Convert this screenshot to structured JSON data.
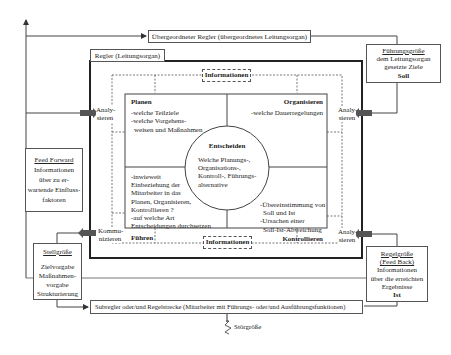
{
  "title_top": "Übergeordneter Regler (übergeordnetes Leitungsorgan)",
  "regler_label": "Regler (Leitungsorgan)",
  "info_top": "Informationen",
  "info_bottom": "Informationen",
  "side_labels": {
    "analysieren_left": [
      "Analy-",
      "sieren"
    ],
    "analysieren_right_top": [
      "Analy-",
      "sieren"
    ],
    "analysieren_right_bottom": [
      "Analy-",
      "sieren"
    ],
    "kommunizieren": [
      "Kommu-",
      "nizieren"
    ]
  },
  "quadrants": {
    "planen": {
      "title": "Planen",
      "lines": [
        "-welche Teilziele",
        "-welche Vorgehens-",
        " weisen und Maßnahmen"
      ]
    },
    "organisieren": {
      "title": "Organisieren",
      "lines": [
        "-welche Dauerregelungen"
      ]
    },
    "fuehren": {
      "title": "Führen",
      "lines": [
        "-inwieweit",
        "Einbeziehung der",
        "Mitarbeiter in das",
        "Planen, Organisieren,",
        "Kontrollieren ?",
        "-auf welche Art",
        "Entscheidungen durchsetzen"
      ]
    },
    "kontrollieren": {
      "title": "Kontrollieren",
      "lines": [
        "-Übereinstimmung von",
        "Soll und Ist",
        "-Ursachen einer",
        "Soll-Ist-Abweichung"
      ]
    }
  },
  "center": {
    "title": "Entscheiden",
    "lines": [
      "Welche Planungs-,",
      "Organisations-,",
      "Kontroll-, Führungs-",
      "alternative"
    ]
  },
  "fuehrungsgroesse": {
    "title": "Führungsgröße",
    "lines": [
      "dem Leitungsorgan",
      "gesetzte Ziele"
    ],
    "bold": "Soll"
  },
  "feed_forward": {
    "title": "Feed Forward",
    "lines": [
      "Informationen",
      "über zu er-",
      "wartende Einfluss-",
      "faktoren"
    ]
  },
  "stellgroesse": {
    "title": "Stellgröße",
    "lines": [
      "Zielvorgabe",
      "Maßnahmen-",
      "vorgabe",
      "Strukturierung"
    ]
  },
  "regelgroesse": {
    "title": "Regelgröße",
    "subtitle": "(Feed Back)",
    "lines": [
      "Informationen",
      "über die erreichten",
      "Ergebnisse"
    ],
    "bold": "Ist"
  },
  "subregler": "Subregler oder/und Regelstrecke (Mitarbeiter mit Führungs- oder/und Ausführungsfunktionen)",
  "stoergroesse": "Störgröße"
}
